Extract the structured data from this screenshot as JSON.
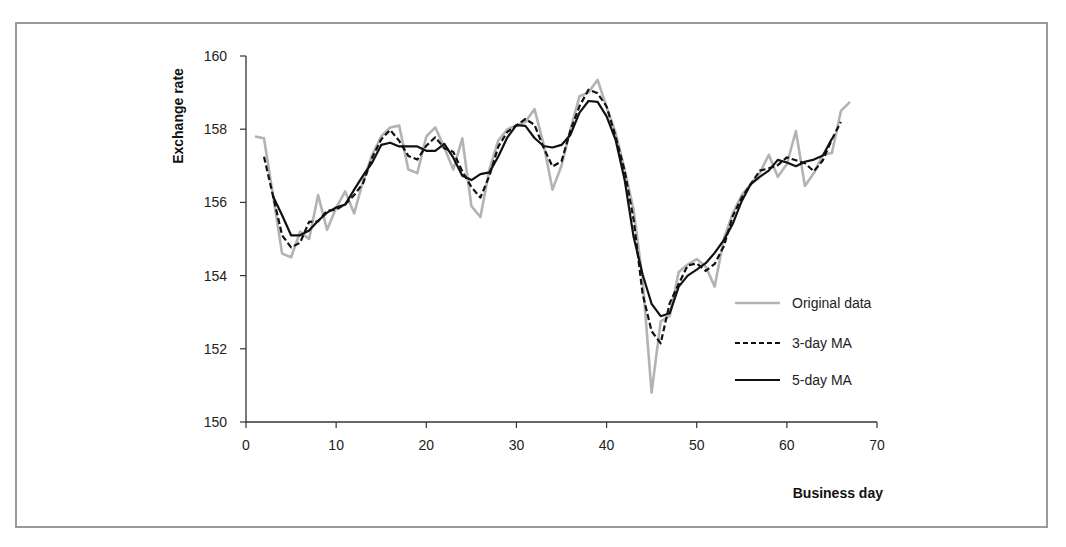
{
  "chart_data": {
    "type": "line",
    "title": "",
    "xlabel": "Business day",
    "ylabel": "Exchange rate",
    "xlim": [
      0,
      70
    ],
    "ylim": [
      150,
      160
    ],
    "xticks": [
      0,
      10,
      20,
      30,
      40,
      50,
      60,
      70
    ],
    "yticks": [
      150,
      152,
      154,
      156,
      158,
      160
    ],
    "grid": false,
    "legend_position": "lower right (inside plot)",
    "series": [
      {
        "name": "Original data",
        "style": "solid",
        "color": "#b3b3b3",
        "x_start": 1,
        "values": [
          157.8,
          157.75,
          156.2,
          154.6,
          154.5,
          155.2,
          155.0,
          156.2,
          155.25,
          155.85,
          156.3,
          155.7,
          156.6,
          157.3,
          157.8,
          158.05,
          158.1,
          156.9,
          156.8,
          157.8,
          158.05,
          157.5,
          156.9,
          157.75,
          155.9,
          155.6,
          156.9,
          157.7,
          158.0,
          158.1,
          158.2,
          158.55,
          157.6,
          156.35,
          157.0,
          158.0,
          158.9,
          159.0,
          159.35,
          158.6,
          157.9,
          156.9,
          155.8,
          153.9,
          150.8,
          152.75,
          152.9,
          154.1,
          154.3,
          154.45,
          154.25,
          153.7,
          155.0,
          155.7,
          156.2,
          156.5,
          156.8,
          157.3,
          156.7,
          157.05,
          157.95,
          156.45,
          156.8,
          157.3,
          157.35,
          158.5,
          158.75
        ]
      },
      {
        "name": "3-day MA",
        "style": "dashed",
        "color": "#111111",
        "x_start": 2,
        "values": [
          157.25,
          156.18,
          155.1,
          154.77,
          154.9,
          155.47,
          155.48,
          155.77,
          155.8,
          155.95,
          156.2,
          156.53,
          157.23,
          157.72,
          157.98,
          157.68,
          157.27,
          157.17,
          157.55,
          157.78,
          157.48,
          157.38,
          156.85,
          156.42,
          156.13,
          156.73,
          157.53,
          157.93,
          158.1,
          158.28,
          158.12,
          157.5,
          156.98,
          157.12,
          157.97,
          158.63,
          159.08,
          158.98,
          158.62,
          157.8,
          156.87,
          155.53,
          153.5,
          152.48,
          152.15,
          153.25,
          153.77,
          154.28,
          154.33,
          154.13,
          154.32,
          154.8,
          155.63,
          156.13,
          156.5,
          156.87,
          156.93,
          157.02,
          157.23,
          157.15,
          157.07,
          156.85,
          157.15,
          157.72,
          158.2
        ]
      },
      {
        "name": "5-day MA",
        "style": "solid",
        "color": "#111111",
        "x_start": 3,
        "values": [
          156.17,
          155.65,
          155.1,
          155.1,
          155.23,
          155.5,
          155.72,
          155.86,
          155.94,
          156.35,
          156.74,
          157.09,
          157.57,
          157.63,
          157.53,
          157.53,
          157.53,
          157.41,
          157.41,
          157.6,
          157.22,
          156.73,
          156.61,
          156.77,
          156.82,
          157.26,
          157.78,
          158.11,
          158.09,
          157.76,
          157.54,
          157.5,
          157.57,
          157.85,
          158.45,
          158.77,
          158.75,
          158.35,
          157.71,
          156.62,
          155.06,
          154.03,
          153.23,
          152.89,
          152.97,
          153.7,
          154.0,
          154.16,
          154.34,
          154.62,
          154.97,
          155.42,
          156.04,
          156.5,
          156.7,
          156.87,
          157.16,
          157.09,
          156.99,
          157.11,
          157.17,
          157.28,
          157.74
        ]
      }
    ]
  },
  "legend": {
    "items": [
      {
        "label": "Original data",
        "style": "solid",
        "color": "#b3b3b3"
      },
      {
        "label": "3-day MA",
        "style": "dashed",
        "color": "#111111"
      },
      {
        "label": "5-day MA",
        "style": "solid",
        "color": "#111111"
      }
    ]
  },
  "axes": {
    "x_title": "Business day",
    "y_title": "Exchange rate",
    "x_tick_labels": [
      "0",
      "10",
      "20",
      "30",
      "40",
      "50",
      "60",
      "70"
    ],
    "y_tick_labels": [
      "150",
      "152",
      "154",
      "156",
      "158",
      "160"
    ]
  }
}
